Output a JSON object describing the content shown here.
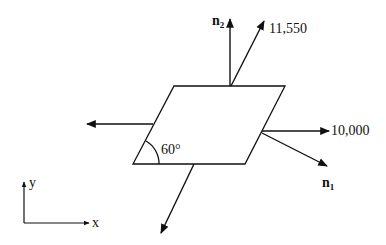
{
  "diagram": {
    "type": "stress element on inclined plane",
    "colors": {
      "stroke": "#111111",
      "background": "#ffffff"
    },
    "labels": {
      "normal_2": "n",
      "normal_2_sub": "2",
      "normal_1": "n",
      "normal_1_sub": "1",
      "force_inclined": "11,550",
      "force_horizontal": "10,000",
      "angle": "60°",
      "axis_x": "x",
      "axis_y": "y"
    },
    "elements": [
      {
        "name": "parallelogram-plate",
        "shape": "parallelogram",
        "angle_deg": 60
      },
      {
        "name": "normal-vector-n2",
        "direction": "up"
      },
      {
        "name": "force-arrow-11550",
        "direction": "up-right",
        "value": "11,550"
      },
      {
        "name": "force-arrow-10000",
        "direction": "right",
        "value": "10,000"
      },
      {
        "name": "normal-vector-n1",
        "direction": "down-right"
      },
      {
        "name": "force-arrow-left",
        "direction": "left"
      },
      {
        "name": "force-arrow-down",
        "direction": "down-left"
      },
      {
        "name": "coordinate-axes",
        "axes": [
          "x",
          "y"
        ]
      }
    ]
  }
}
